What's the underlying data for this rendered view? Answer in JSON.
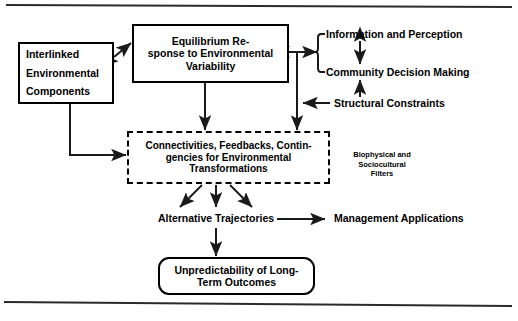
{
  "figure": {
    "background_color": "#ffffff",
    "line_color": "#000000",
    "text_color": "#000000",
    "rule_color": "#2b2b2b"
  },
  "nodes": {
    "interlinked": {
      "label": "Interlinked\nEnvironmental\nComponents",
      "shape": "rectangle"
    },
    "equilibrium": {
      "label": "Equilibrium Re-\nsponse to Environmental\nVariability",
      "shape": "rectangle"
    },
    "information": {
      "label": "Information and Perception",
      "shape": "text"
    },
    "community": {
      "label": "Community Decision Making",
      "shape": "text"
    },
    "structural": {
      "label": "Structural Constraints",
      "shape": "text"
    },
    "connectivities": {
      "label": "Connectivities, Feedbacks, Contin-\ngencies for Environmental\nTransformations",
      "shape": "dashed-rectangle"
    },
    "filters": {
      "label": "Biophysical and\nSociocultural\nFilters",
      "shape": "text"
    },
    "trajectories": {
      "label": "Alternative Trajectories",
      "shape": "text"
    },
    "management": {
      "label": "Management Applications",
      "shape": "text"
    },
    "unpredictability": {
      "label": "Unpredictability of Long-\nTerm Outcomes",
      "shape": "rounded-rectangle"
    }
  },
  "connections": [
    {
      "id": "interlinked-equilibrium",
      "from": "interlinked",
      "to": "equilibrium",
      "style": "double-arrow"
    },
    {
      "id": "equilibrium-connectivities",
      "from": "equilibrium",
      "to": "connectivities",
      "style": "arrow"
    },
    {
      "id": "equilibrium-brace",
      "from": "equilibrium",
      "to": "brace",
      "style": "double-arrow"
    },
    {
      "id": "information-community",
      "from": "information",
      "to": "community",
      "style": "double-arrow"
    },
    {
      "id": "structural-community",
      "from": "structural",
      "to": "community",
      "style": "arrow"
    },
    {
      "id": "structural-trunk",
      "from": "structural",
      "to": "trunk",
      "style": "arrow"
    },
    {
      "id": "trunk-connectivities",
      "from": "trunk",
      "to": "connectivities",
      "style": "arrow"
    },
    {
      "id": "interlinked-connectivities",
      "from": "interlinked",
      "to": "connectivities",
      "style": "arrow"
    },
    {
      "id": "connectivities-trajectories-left",
      "from": "connectivities",
      "to": "trajectories",
      "style": "arrow"
    },
    {
      "id": "connectivities-trajectories-center",
      "from": "connectivities",
      "to": "trajectories",
      "style": "arrow"
    },
    {
      "id": "connectivities-trajectories-right",
      "from": "connectivities",
      "to": "trajectories",
      "style": "arrow"
    },
    {
      "id": "trajectories-management",
      "from": "trajectories",
      "to": "management",
      "style": "arrow"
    },
    {
      "id": "trajectories-unpredictability",
      "from": "trajectories",
      "to": "unpredictability",
      "style": "arrow"
    }
  ]
}
